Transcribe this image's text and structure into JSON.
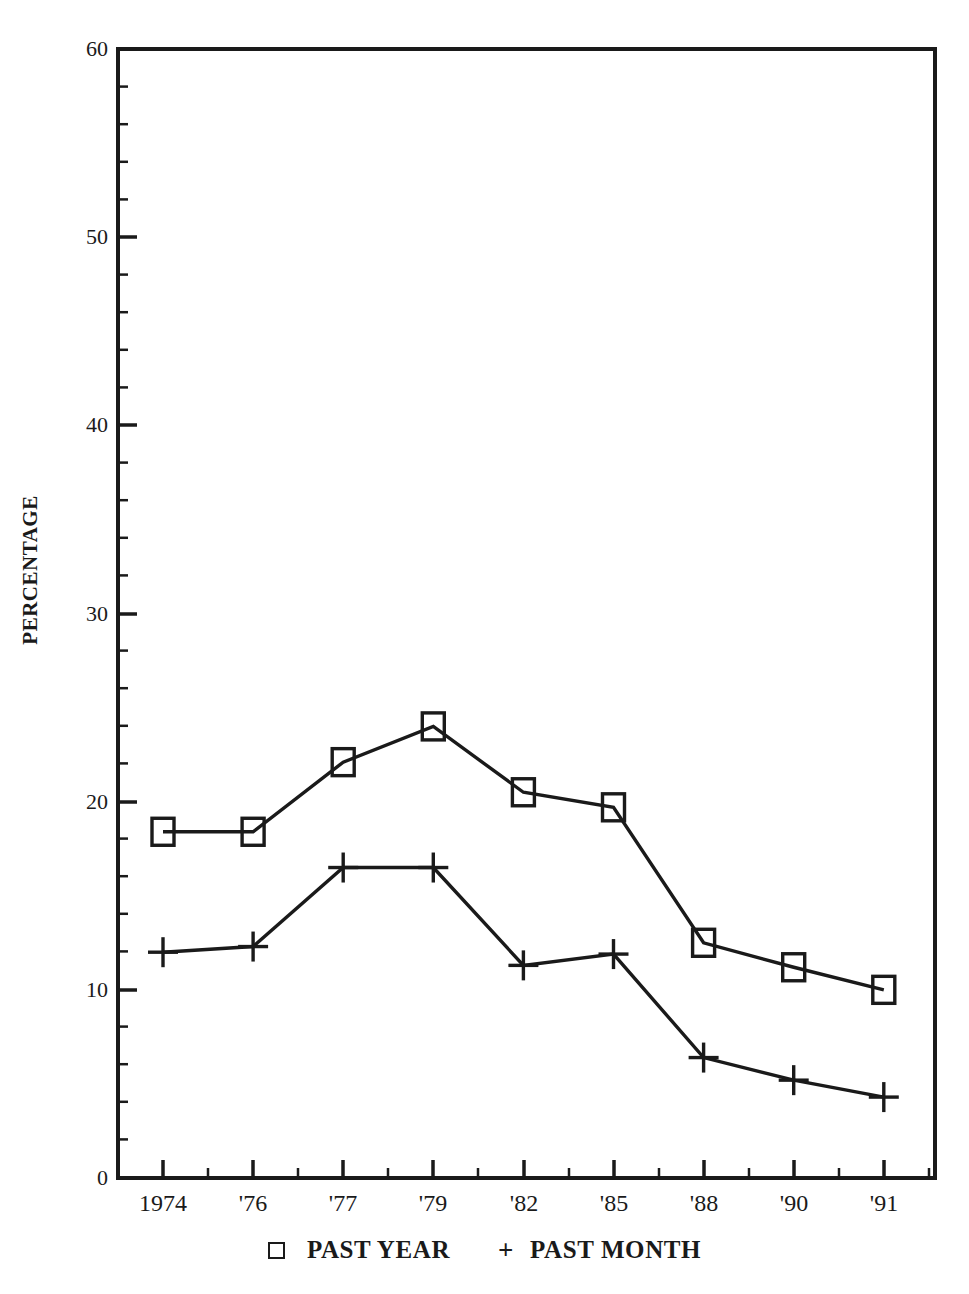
{
  "chart_data": {
    "type": "line",
    "title": "",
    "xlabel": "",
    "ylabel": "PERCENTAGE",
    "categories": [
      "1974",
      "'76",
      "'77",
      "'79",
      "'82",
      "'85",
      "'88",
      "'90",
      "'91"
    ],
    "ylim": [
      0,
      60
    ],
    "yticks": [
      0,
      10,
      20,
      30,
      40,
      50,
      60
    ],
    "ytick_labels": [
      "0",
      "10",
      "20",
      "30",
      "40",
      "50",
      "60"
    ],
    "minor_ticks": true,
    "grid": false,
    "legend_position": "bottom",
    "series": [
      {
        "name": "PAST YEAR",
        "marker": "square",
        "values": [
          18.4,
          18.4,
          22.1,
          24.0,
          20.5,
          19.7,
          12.5,
          11.2,
          10.0
        ]
      },
      {
        "name": "PAST MONTH",
        "marker": "plus",
        "values": [
          12.0,
          12.3,
          16.5,
          16.5,
          11.3,
          11.9,
          6.4,
          5.2,
          4.3
        ]
      }
    ]
  },
  "axes": {
    "y_title": "PERCENTAGE",
    "y_labels": [
      "60",
      "50",
      "40",
      "30",
      "20",
      "10",
      "0"
    ],
    "x_labels": [
      "1974",
      "'76",
      "'77",
      "'79",
      "'82",
      "'85",
      "'88",
      "'90",
      "'91"
    ]
  },
  "legend": {
    "past_year_marker": "square-marker",
    "past_year_label": "PAST YEAR",
    "past_month_marker": "+",
    "past_month_label": "PAST MONTH"
  },
  "colors": {
    "ink": "#1a1a1a",
    "background": "#ffffff"
  }
}
